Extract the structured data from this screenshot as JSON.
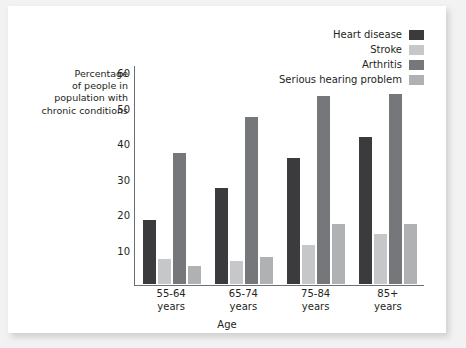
{
  "figure": {
    "background": "#f2f2f2",
    "card_background": "#ffffff"
  },
  "legend": {
    "position": "top-right",
    "items": [
      {
        "label": "Heart disease",
        "color": "#3b3b3d"
      },
      {
        "label": "Stroke",
        "color": "#c6c7c9"
      },
      {
        "label": "Arthritis",
        "color": "#76777a"
      },
      {
        "label": "Serious hearing problem",
        "color": "#b0b1b3"
      }
    ]
  },
  "axes": {
    "y_title_lines": [
      "Percentage",
      "of people in",
      "population with",
      "chronic conditions"
    ],
    "x_title": "Age",
    "y_ticks": [
      60,
      50,
      40,
      30,
      20,
      10
    ],
    "y_min": 0,
    "y_max": 62,
    "axis_color": "#6d6e71"
  },
  "chart_data": {
    "type": "bar",
    "title": "",
    "xlabel": "Age",
    "ylabel": "Percentage of people in population with chronic conditions",
    "categories": [
      "55-64\nyears",
      "65-74\nyears",
      "75-84\nyears",
      "85+\nyears"
    ],
    "category_lines": [
      [
        "55-64",
        "years"
      ],
      [
        "65-74",
        "years"
      ],
      [
        "75-84",
        "years"
      ],
      [
        "85+",
        "years"
      ]
    ],
    "ylim": [
      0,
      62
    ],
    "yticks": [
      10,
      20,
      30,
      40,
      50,
      60
    ],
    "grid": false,
    "legend_position": "top-right",
    "series": [
      {
        "name": "Heart disease",
        "color": "#3b3b3d",
        "values": [
          18,
          27,
          35.5,
          41.5
        ]
      },
      {
        "name": "Stroke",
        "color": "#c6c7c9",
        "values": [
          7,
          6.5,
          11,
          14
        ]
      },
      {
        "name": "Arthritis",
        "color": "#76777a",
        "values": [
          37,
          47,
          53,
          53.5
        ]
      },
      {
        "name": "Serious hearing problem",
        "color": "#b0b1b3",
        "values": [
          5,
          7.5,
          17,
          17
        ]
      }
    ]
  }
}
